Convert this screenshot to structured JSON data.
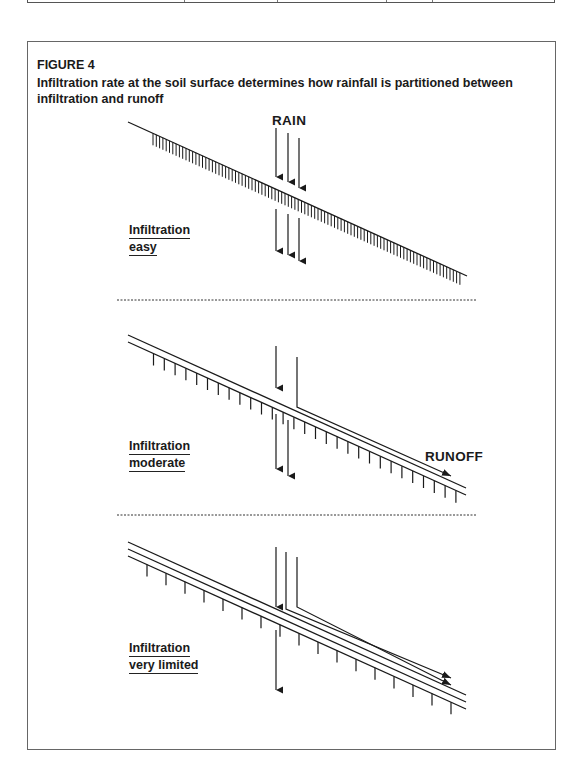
{
  "figure": {
    "number": "FIGURE 4",
    "caption": "Infiltration rate at the soil surface determines how rainfall is partitioned between infiltration and runoff"
  },
  "labels": {
    "rain": "RAIN",
    "runoff": "RUNOFF"
  },
  "panels": [
    {
      "line1": "Infiltration",
      "line2": "easy",
      "surface_lines": 1,
      "rain_arrows": 3,
      "infiltration_arrows": 3,
      "runoff_arrows": 0
    },
    {
      "line1": "Infiltration",
      "line2": "moderate",
      "surface_lines": 2,
      "rain_arrows": 2,
      "infiltration_arrows": 2,
      "runoff_arrows": 1
    },
    {
      "line1": "Infiltration",
      "line2": "very limited",
      "surface_lines": 3,
      "rain_arrows": 3,
      "infiltration_arrows": 1,
      "runoff_arrows": 2
    }
  ],
  "colors": {
    "ink": "#1a1a1a",
    "border": "#666666"
  }
}
